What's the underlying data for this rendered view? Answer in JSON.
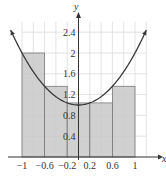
{
  "chart_data": {
    "type": "bar",
    "title": "",
    "xlabel": "x",
    "ylabel": "y",
    "function": "y = x^2 + 1",
    "x_ticks": [
      "-1",
      "-0.6",
      "-0.2",
      "0.2",
      "0.6",
      "1"
    ],
    "x_tick_values": [
      -1,
      -0.6,
      -0.2,
      0.2,
      0.6,
      1
    ],
    "y_ticks": [
      "0.4",
      "0.8",
      "1.2",
      "1.6",
      "2",
      "2.4"
    ],
    "y_tick_values": [
      0.4,
      0.8,
      1.2,
      1.6,
      2,
      2.4
    ],
    "xlim": [
      -1.1,
      1.2
    ],
    "ylim": [
      0,
      2.6
    ],
    "grid": true,
    "grid_x_step": 0.2,
    "grid_y_step": 0.4,
    "categories": [
      "[-1,-0.6]",
      "[-0.6,-0.2]",
      "[-0.2,0.2]",
      "[0.2,0.6]",
      "[0.6,1]"
    ],
    "bars": [
      {
        "x0": -1.0,
        "x1": -0.6,
        "height": 2.0
      },
      {
        "x0": -0.6,
        "x1": -0.2,
        "height": 1.36
      },
      {
        "x0": -0.2,
        "x1": 0.2,
        "height": 1.04
      },
      {
        "x0": 0.2,
        "x1": 0.6,
        "height": 1.04
      },
      {
        "x0": 0.6,
        "x1": 1.0,
        "height": 1.36
      }
    ],
    "values": [
      2.0,
      1.36,
      1.04,
      1.04,
      1.36
    ],
    "curve": {
      "x": [
        -1.2,
        -1.0,
        -0.8,
        -0.6,
        -0.4,
        -0.2,
        0,
        0.2,
        0.4,
        0.6,
        0.8,
        1.0,
        1.2
      ],
      "y": [
        2.44,
        2.0,
        1.64,
        1.36,
        1.16,
        1.04,
        1.0,
        1.04,
        1.16,
        1.36,
        1.64,
        2.0,
        2.44
      ]
    },
    "colors": {
      "bar_fill": "#c8c8c8",
      "bar_edge": "#7a7a7a",
      "curve": "#3a3a3a",
      "grid": "#dcdcdc",
      "axis": "#333333"
    }
  }
}
